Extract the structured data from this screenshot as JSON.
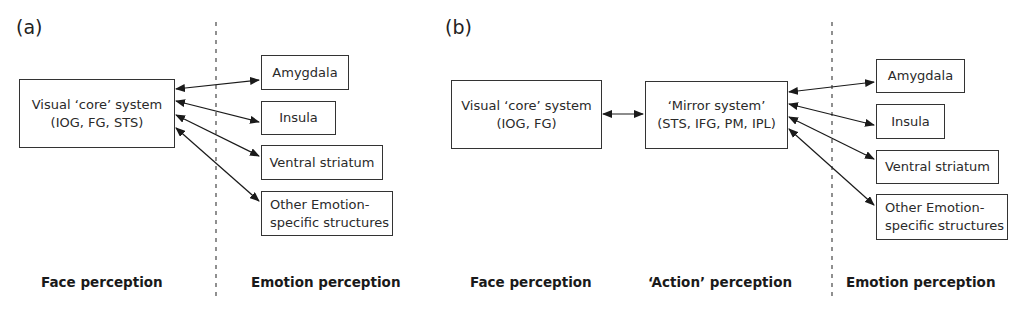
{
  "panels": {
    "a": {
      "label": "(a)",
      "core": {
        "line1": "Visual ‘core’ system",
        "line2": "(IOG, FG, STS)"
      },
      "targets": [
        {
          "line1": "Amygdala"
        },
        {
          "line1": "Insula"
        },
        {
          "line1": "Ventral striatum"
        },
        {
          "line1": "Other Emotion-",
          "line2": "specific structures"
        }
      ],
      "footer": {
        "face": "Face perception",
        "emotion": "Emotion perception"
      }
    },
    "b": {
      "label": "(b)",
      "core": {
        "line1": "Visual ‘core’ system",
        "line2": "(IOG, FG)"
      },
      "mirror": {
        "line1": "‘Mirror system’",
        "line2": "(STS, IFG, PM, IPL)"
      },
      "targets": [
        {
          "line1": "Amygdala"
        },
        {
          "line1": "Insula"
        },
        {
          "line1": "Ventral striatum"
        },
        {
          "line1": "Other Emotion-",
          "line2": "specific structures"
        }
      ],
      "footer": {
        "face": "Face perception",
        "action": "‘Action’ perception",
        "emotion": "Emotion perception"
      }
    }
  },
  "connections": {
    "a": [
      {
        "from": "Visual core system",
        "to": "Amygdala",
        "type": "bidirectional"
      },
      {
        "from": "Visual core system",
        "to": "Insula",
        "type": "bidirectional"
      },
      {
        "from": "Visual core system",
        "to": "Ventral striatum",
        "type": "bidirectional"
      },
      {
        "from": "Visual core system",
        "to": "Other Emotion-specific structures",
        "type": "bidirectional"
      }
    ],
    "b": [
      {
        "from": "Visual core system",
        "to": "Mirror system",
        "type": "bidirectional"
      },
      {
        "from": "Mirror system",
        "to": "Amygdala",
        "type": "bidirectional"
      },
      {
        "from": "Mirror system",
        "to": "Insula",
        "type": "bidirectional"
      },
      {
        "from": "Mirror system",
        "to": "Ventral striatum",
        "type": "bidirectional"
      },
      {
        "from": "Mirror system",
        "to": "Other Emotion-specific structures",
        "type": "bidirectional"
      }
    ]
  },
  "colors": {
    "line": "#1a1a1a",
    "divider": "#555555",
    "text": "#1a1a1a"
  }
}
